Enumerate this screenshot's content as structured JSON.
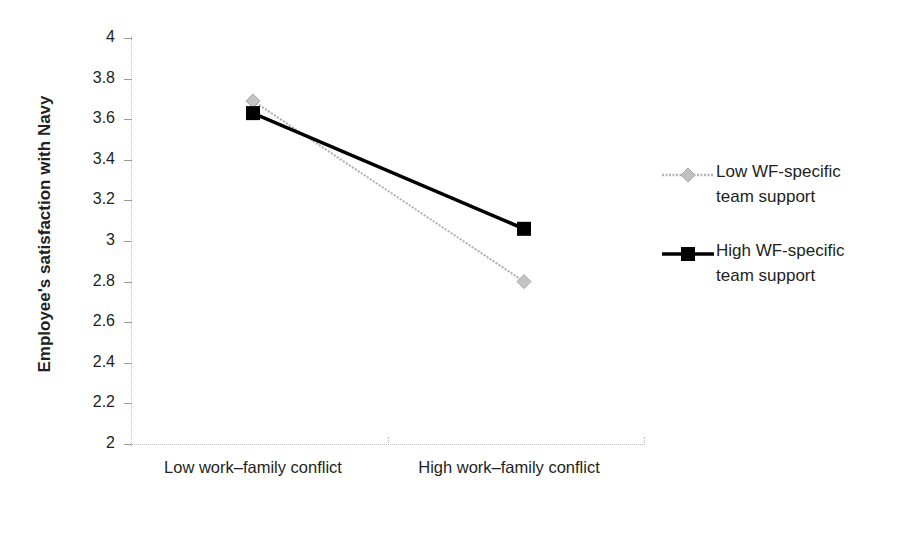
{
  "chart_data": {
    "type": "line",
    "title": "",
    "xlabel": "",
    "ylabel": "Employee's satisfaction with Navy",
    "categories": [
      "Low work–family conflict",
      "High work–family conflict"
    ],
    "ylim": [
      2,
      4
    ],
    "ytick_step": 0.2,
    "ytick_labels": [
      "4",
      "3.8",
      "3.6",
      "3.4",
      "3.2",
      "3",
      "2.8",
      "2.6",
      "2.4",
      "2.2",
      "2"
    ],
    "ytick_values": [
      4,
      3.8,
      3.6,
      3.4,
      3.2,
      3,
      2.8,
      2.6,
      2.4,
      2.2,
      2
    ],
    "grid": false,
    "legend_position": "right",
    "series": [
      {
        "name": "Low WF-specific team support",
        "values": [
          3.69,
          2.8
        ],
        "color": "#b3b3b3",
        "marker": "diamond",
        "line_width": 2
      },
      {
        "name": "High WF-specific team support",
        "values": [
          3.63,
          3.06
        ],
        "color": "#000000",
        "marker": "square",
        "line_width": 3.5
      }
    ]
  },
  "axis": {
    "y_title": "Employee's satisfaction with Navy",
    "axis_color": "#bfbfbf",
    "tick_color": "#9a9a9a"
  },
  "legend": {
    "entries": [
      {
        "label_line1": "Low WF-specific",
        "label_line2": "team support",
        "marker": "diamond-marker",
        "color": "#b3b3b3"
      },
      {
        "label_line1": "High WF-specific",
        "label_line2": "team support",
        "marker": "square-marker",
        "color": "#000000"
      }
    ]
  }
}
